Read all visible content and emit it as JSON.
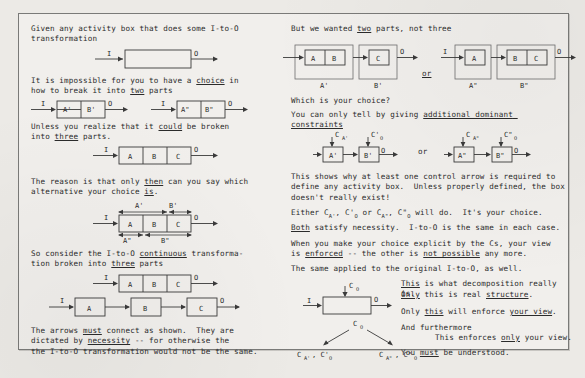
{
  "document": {
    "type": "scanned-handout",
    "page_background": "#eceae6",
    "frame_border_color": "#7a7a78",
    "ink_color": "#2b2b2b"
  },
  "left_column": {
    "p1": "Given any activity box that does some I-to-O\ntransformation",
    "p2_a": "It is impossible for you to have a ",
    "p2_choice": "choice",
    "p2_b": " in\nhow to break it into ",
    "p2_two": "two",
    "p2_c": " parts",
    "p3_a": "Unless you realize that it ",
    "p3_could": "could",
    "p3_b": " be broken\ninto ",
    "p3_three": "three",
    "p3_c": " parts.",
    "p4_a": "The reason is that only ",
    "p4_then": "then",
    "p4_b": " can you say which\nalternative your choice ",
    "p4_is": "is",
    "p4_c": ".",
    "p5_a": "So consider the I-to-O ",
    "p5_continuous": "continuous",
    "p5_b": " transforma-\ntion broken into ",
    "p5_three": "three",
    "p5_c": " parts",
    "p6_a": "The arrows ",
    "p6_must": "must",
    "p6_b": " connect as shown.  They are\ndictated by ",
    "p6_necessity": "necessity",
    "p6_c": " -- for otherwise the\nthe I-to-O transformation would not be the same."
  },
  "right_column": {
    "p1_a": "But we wanted ",
    "p1_two": "two",
    "p1_b": " parts, not three",
    "p2": "Which is your choice?",
    "p3_a": "You can only tell by giving ",
    "p3_add": "additional dominant constraints",
    "p4": "This shows why at least one control arrow is required to\ndefine any activity box.  Unless properly defined, the box\ndoesn't really exist!",
    "p5": "Either C",
    "p5_full": "Either C_A', C'_O or C_A\", C\"_O will do.  It's your choice.",
    "p6_both": "Both",
    "p6_rest": " satisfy necessity.  I-to-O is the same in each case.",
    "p7_a": "When you make your choice explicit by the Cs, your view\nis ",
    "p7_enforced": "enforced",
    "p7_b": " -- the other is ",
    "p7_not": "not possible",
    "p7_c": " any more.",
    "p8": "The same applied to the original I-to-O, as well.",
    "r1_a": "This",
    "r1_b": " is what decomposition really is.",
    "r2_a": "Only",
    "r2_b": " this",
    "r2_c": " is real ",
    "r2_d": "structure",
    "r2_e": ".",
    "r3_a": "Only ",
    "r3_b": "this",
    "r3_c": " will enforce ",
    "r3_d": "your view",
    "r3_e": ".",
    "r4": "And furthermore",
    "r5_a": "This enforces ",
    "r5_b": "only",
    "r5_c": " your view.",
    "r6_a": "You ",
    "r6_b": "must",
    "r6_c": " be understood.",
    "or_label": "or"
  },
  "diagrams": {
    "d1": {
      "name": "empty-activity-box",
      "input": "I",
      "output": "O",
      "boxes": []
    },
    "d2": {
      "name": "two-parts-prime",
      "input": "I",
      "output": "O",
      "boxes": [
        "A'",
        "B'"
      ]
    },
    "d3": {
      "name": "two-parts-doubleprime",
      "input": "I",
      "output": "O",
      "boxes": [
        "A\"",
        "B\""
      ]
    },
    "d4": {
      "name": "three-parts-abc",
      "input": "I",
      "output": "O",
      "boxes": [
        "A",
        "B",
        "C"
      ]
    },
    "d5": {
      "name": "three-parts-with-spans",
      "input": "I",
      "output": "O",
      "boxes": [
        "A",
        "B",
        "C"
      ],
      "top_spans": [
        "A'",
        "B'"
      ],
      "bottom_spans": [
        "A\"",
        "B\""
      ]
    },
    "d6": {
      "name": "three-parts-contiguous",
      "input": "I",
      "output": "O",
      "boxes": [
        "A",
        "B",
        "C"
      ]
    },
    "d7": {
      "name": "three-parts-separated",
      "input": "I",
      "output": "O",
      "boxes": [
        "A",
        "B",
        "C"
      ]
    },
    "d8": {
      "name": "grouping-prime",
      "input": "I",
      "output": "O",
      "group1": {
        "label": "A'",
        "boxes": [
          "A",
          "B"
        ]
      },
      "group2": {
        "label": "B'",
        "boxes": [
          "C"
        ]
      }
    },
    "d9": {
      "name": "grouping-doubleprime",
      "input": "I",
      "output": "O",
      "group1": {
        "label": "A\"",
        "boxes": [
          "A"
        ]
      },
      "group2": {
        "label": "B\"",
        "boxes": [
          "B",
          "C"
        ]
      }
    },
    "d10": {
      "name": "constraints-prime",
      "input": "I",
      "output": "O",
      "boxes": [
        "A'",
        "B'"
      ],
      "controls": [
        "C_A'",
        "C'_O"
      ]
    },
    "d11": {
      "name": "constraints-doubleprime",
      "input": "I",
      "output": "O",
      "boxes": [
        "A\"",
        "B\""
      ],
      "controls": [
        "C_A\"",
        "C\"_O"
      ]
    },
    "d12": {
      "name": "original-box-with-control",
      "input": "I",
      "output": "O",
      "control": "C_O"
    },
    "d13": {
      "name": "choice-tree",
      "root": "C_O",
      "left_leaf": "C_A', C'_O",
      "right_leaf": "C_A\", C\"_O"
    }
  },
  "glyphs": {
    "C": "C",
    "A_prime": "A'",
    "A_dprime": "A\"",
    "O_sub": "O",
    "prime": "'",
    "dprime": "\""
  }
}
